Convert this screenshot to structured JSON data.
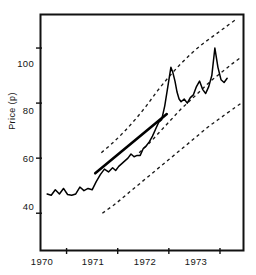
{
  "chart_data": {
    "type": "line",
    "title": "",
    "xlabel": "",
    "ylabel": "Price (p)",
    "xlim": [
      1969.5,
      1973.45
    ],
    "ylim": [
      27,
      112
    ],
    "grid": false,
    "legend": null,
    "x_ticks": [
      1970,
      1971,
      1972,
      1973
    ],
    "x_tick_labels": [
      "1970",
      "1971",
      "1972",
      "1973"
    ],
    "y_ticks": [
      40,
      60,
      80,
      100
    ],
    "y_tick_labels": [
      "40",
      "60",
      "80",
      "100"
    ],
    "series": [
      {
        "name": "price",
        "style": "solid",
        "color": "#000000",
        "x": [
          1969.62,
          1969.7,
          1969.78,
          1969.86,
          1969.94,
          1970.02,
          1970.1,
          1970.18,
          1970.26,
          1970.34,
          1970.42,
          1970.5,
          1970.58,
          1970.66,
          1970.74,
          1970.82,
          1970.9,
          1970.96,
          1971.02,
          1971.08,
          1971.14,
          1971.2,
          1971.26,
          1971.32,
          1971.38,
          1971.44,
          1971.5,
          1971.56,
          1971.62,
          1971.68,
          1971.74,
          1971.8,
          1971.86,
          1971.92,
          1971.98,
          1972.04,
          1972.08,
          1972.12,
          1972.16,
          1972.2,
          1972.24,
          1972.3,
          1972.36,
          1972.42,
          1972.48,
          1972.54,
          1972.6,
          1972.66,
          1972.72,
          1972.78,
          1972.84,
          1972.9,
          1972.96,
          1973.02,
          1973.08,
          1973.14
        ],
        "y": [
          47.0,
          46.5,
          48.5,
          47.0,
          49.0,
          46.8,
          46.5,
          47.0,
          49.5,
          48.2,
          49.0,
          48.5,
          51.5,
          54.0,
          56.0,
          55.0,
          56.5,
          55.5,
          57.0,
          58.0,
          59.0,
          60.0,
          61.5,
          60.5,
          61.0,
          61.0,
          63.5,
          64.5,
          66.0,
          68.0,
          70.5,
          73.0,
          74.0,
          79.0,
          86.0,
          93.0,
          91.0,
          88.0,
          84.0,
          81.5,
          80.5,
          81.5,
          80.0,
          82.0,
          83.0,
          86.0,
          88.0,
          85.0,
          83.5,
          86.0,
          90.0,
          100.0,
          93.0,
          88.5,
          87.5,
          89.0
        ]
      },
      {
        "name": "trend-segment",
        "style": "solid-thick",
        "color": "#000000",
        "x": [
          1970.56,
          1971.96
        ],
        "y": [
          54.5,
          76.0
        ]
      },
      {
        "name": "upper-band",
        "style": "dashed",
        "color": "#1a1a1a",
        "x": [
          1970.68,
          1970.9,
          1971.12,
          1971.34,
          1971.56,
          1971.78,
          1972.0,
          1972.22,
          1972.44,
          1972.66,
          1972.88,
          1973.1,
          1973.32
        ],
        "y": [
          62.0,
          65.5,
          69.5,
          74.0,
          79.0,
          84.5,
          89.5,
          94.0,
          98.0,
          101.5,
          104.5,
          107.5,
          110.5
        ]
      },
      {
        "name": "middle-band",
        "style": "dashed",
        "color": "#1a1a1a",
        "x": [
          1971.42,
          1971.62,
          1971.82,
          1972.02,
          1972.22,
          1972.42,
          1972.62,
          1972.82,
          1973.02,
          1973.22,
          1973.4
        ],
        "y": [
          62.0,
          65.5,
          69.5,
          73.5,
          77.5,
          81.0,
          84.5,
          88.0,
          91.0,
          94.0,
          96.5
        ]
      },
      {
        "name": "lower-band",
        "style": "dashed",
        "color": "#1a1a1a",
        "x": [
          1970.7,
          1970.96,
          1971.22,
          1971.48,
          1971.74,
          1972.0,
          1972.26,
          1972.52,
          1972.78,
          1973.04,
          1973.3,
          1973.42
        ],
        "y": [
          40.0,
          43.5,
          47.5,
          51.5,
          55.5,
          59.5,
          63.5,
          67.5,
          71.5,
          75.0,
          78.5,
          80.0
        ]
      }
    ]
  },
  "axes": {
    "y_label": "Price (p)",
    "y_tick_labels": [
      "100",
      "80",
      "60",
      "40"
    ],
    "x_tick_labels": [
      "1970",
      "1971",
      "1972",
      "1973"
    ]
  }
}
